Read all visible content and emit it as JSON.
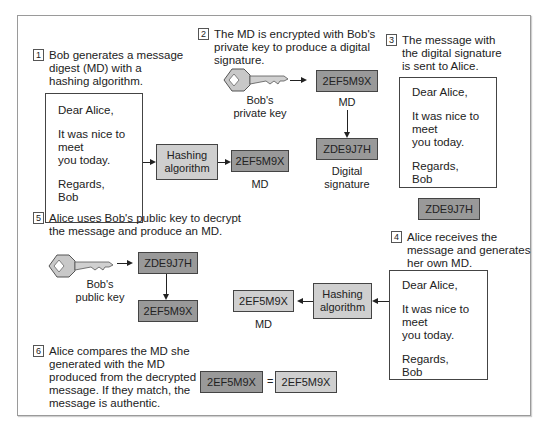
{
  "colors": {
    "md_dark": "#999999",
    "md_light": "#cfcfcf",
    "border": "#444444"
  },
  "steps": [
    {
      "num": "1",
      "text": [
        "Bob generates a message",
        "digest (MD) with a",
        "hashing algorithm."
      ]
    },
    {
      "num": "2",
      "text": [
        "The MD is encrypted with Bob's",
        "private key to produce a digital",
        "signature."
      ]
    },
    {
      "num": "3",
      "text": [
        "The message with",
        "the digital signature",
        "is sent to Alice."
      ]
    },
    {
      "num": "4",
      "text": [
        "Alice receives the",
        "message and generates",
        "her own MD."
      ]
    },
    {
      "num": "5",
      "text": [
        "Alice uses Bob's public key to decrypt",
        "the message and produce an MD."
      ]
    },
    {
      "num": "6",
      "text": [
        "Alice compares the MD she",
        "generated with the MD",
        "produced from the decrypted",
        "message. If they match, the",
        "message is authentic."
      ]
    }
  ],
  "letter": {
    "greeting": "Dear Alice,",
    "body": [
      "It was nice to",
      "meet",
      "you today."
    ],
    "closing": [
      "Regards,",
      "Bob"
    ]
  },
  "hashing": {
    "line1": "Hashing",
    "line2": "algorithm"
  },
  "md_value": "2EF5M9X",
  "signature_value": "ZDE9J7H",
  "labels": {
    "md": "MD",
    "digital_signature": [
      "Digital",
      "signature"
    ],
    "private_key": [
      "Bob's",
      "private key"
    ],
    "public_key": [
      "Bob's",
      "public key"
    ],
    "equals": "="
  }
}
